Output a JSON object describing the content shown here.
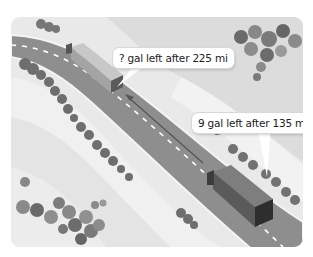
{
  "illustration": {
    "description": "Two trucks traveling on a highway with fuel callouts",
    "colors": {
      "background": "#e9e9e9",
      "road": "#8e8e8e",
      "road_edge": "#f4f4f4",
      "lane_dash": "#ffffff",
      "trees_dark": "#6a6a6a",
      "trees_light": "#8c8c8c",
      "arrow": "#555555",
      "callout_bg": "#ffffff",
      "callout_text": "#222222"
    },
    "callouts": [
      {
        "id": "future-truck",
        "text": "? gal left after 225 mi"
      },
      {
        "id": "current-truck",
        "text": "9 gal left after 135 mi"
      }
    ],
    "arrow": {
      "direction": "travel direction from current truck toward future truck"
    }
  }
}
